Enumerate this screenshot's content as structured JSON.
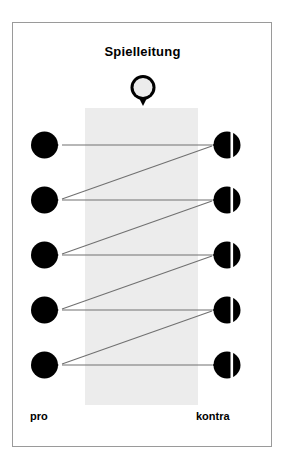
{
  "diagram": {
    "title": "Spielleitung",
    "type": "debate-turn-taking-flow",
    "moderator": {
      "icon": "moderator-token-icon",
      "label": "Spielleitung",
      "style": "outlined-circle-with-tail",
      "fill": "#ececec",
      "stroke": "#000000"
    },
    "colors": {
      "ink": "#000000",
      "band": "#ececec",
      "frame": "#9a9a9a",
      "line": "#707070",
      "background": "#ffffff"
    },
    "band": {
      "name": "discussion-floor-band",
      "fill": "#ececec",
      "x": 85,
      "y": 108,
      "width": 113,
      "height": 297
    },
    "sides": {
      "left": {
        "label": "pro",
        "token_style": "solid-circle-tail-right",
        "token_count": 5
      },
      "right": {
        "label": "kontra",
        "token_style": "split-circle-tail-left",
        "token_count": 5
      }
    },
    "rows": [
      {
        "index": 1,
        "y": 145,
        "pro_token": "pro-token-1",
        "kontra_token": "kontra-token-1"
      },
      {
        "index": 2,
        "y": 200,
        "pro_token": "pro-token-2",
        "kontra_token": "kontra-token-2"
      },
      {
        "index": 3,
        "y": 255,
        "pro_token": "pro-token-3",
        "kontra_token": "kontra-token-3"
      },
      {
        "index": 4,
        "y": 310,
        "pro_token": "pro-token-4",
        "kontra_token": "kontra-token-4"
      },
      {
        "index": 5,
        "y": 365,
        "pro_token": "pro-token-5",
        "kontra_token": "kontra-token-5"
      }
    ],
    "connections": {
      "horizontal_count": 5,
      "diagonal_count": 4,
      "description": "Each row links pro to kontra horizontally; a diagonal returns from each kontra token down to the next pro token."
    },
    "geometry": {
      "left_token_cx": 46,
      "right_token_cx": 228,
      "line_left_x": 62,
      "line_right_x": 212
    }
  }
}
